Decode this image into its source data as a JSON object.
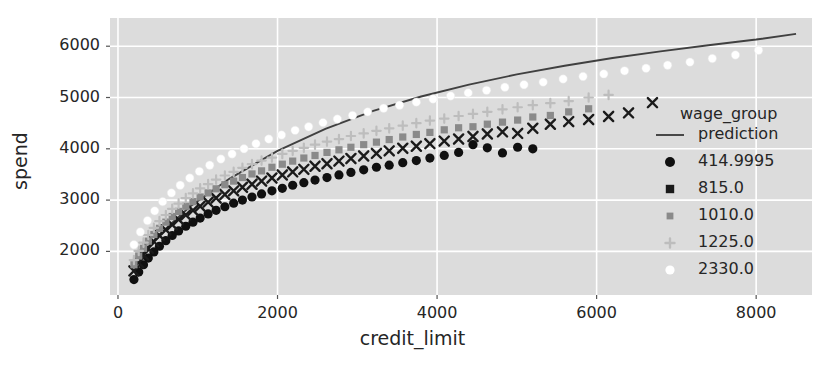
{
  "chart_data": {
    "type": "scatter",
    "title": "",
    "xlabel": "credit_limit",
    "ylabel": "spend",
    "xlim": [
      -100,
      8700
    ],
    "ylim": [
      1150,
      6550
    ],
    "xticks": [
      0,
      2000,
      4000,
      6000,
      8000
    ],
    "yticks": [
      2000,
      3000,
      4000,
      5000,
      6000
    ],
    "xtick_labels": [
      "0",
      "2000",
      "4000",
      "6000",
      "8000"
    ],
    "ytick_labels": [
      "2000",
      "3000",
      "4000",
      "5000",
      "6000"
    ],
    "grid": true,
    "grid_color": "#ffffff",
    "plot_bgcolor": "#dcdcdc",
    "fig_bgcolor": "#ffffff",
    "legend_title": "wage_group",
    "legend_position": "right",
    "series": [
      {
        "name": "prediction",
        "type": "line",
        "marker": "line",
        "color": "#404040",
        "x": [
          180,
          500,
          900,
          1400,
          2000,
          2600,
          3200,
          3800,
          4400,
          5000,
          5600,
          6200,
          6800,
          7400,
          8000,
          8500
        ],
        "y": [
          1700,
          2300,
          2870,
          3420,
          3960,
          4390,
          4740,
          5020,
          5250,
          5450,
          5620,
          5770,
          5900,
          6020,
          6130,
          6240
        ]
      },
      {
        "name": "414.9995",
        "type": "scatter",
        "marker": "circle",
        "color": "#101010",
        "x": [
          200,
          260,
          320,
          380,
          450,
          520,
          600,
          680,
          760,
          850,
          940,
          1030,
          1130,
          1230,
          1340,
          1450,
          1560,
          1680,
          1800,
          1930,
          2060,
          2190,
          2330,
          2470,
          2620,
          2770,
          2920,
          3080,
          3240,
          3400,
          3570,
          3740,
          3910,
          4090,
          4270,
          4450,
          4630,
          4820,
          5010,
          5200
        ],
        "y": [
          1450,
          1600,
          1740,
          1870,
          1990,
          2100,
          2210,
          2310,
          2400,
          2490,
          2570,
          2650,
          2730,
          2800,
          2870,
          2940,
          3000,
          3060,
          3120,
          3180,
          3230,
          3290,
          3340,
          3390,
          3440,
          3490,
          3540,
          3590,
          3640,
          3680,
          3730,
          3770,
          3820,
          3870,
          3930,
          4080,
          4020,
          3920,
          4030,
          4000
        ]
      },
      {
        "name": "815.0",
        "type": "scatter",
        "marker": "x",
        "color": "#1a1a1a",
        "x": [
          200,
          260,
          320,
          380,
          450,
          520,
          600,
          680,
          760,
          850,
          940,
          1030,
          1130,
          1230,
          1340,
          1450,
          1560,
          1680,
          1800,
          1930,
          2060,
          2190,
          2330,
          2470,
          2620,
          2770,
          2920,
          3080,
          3240,
          3400,
          3570,
          3740,
          3910,
          4090,
          4270,
          4450,
          4630,
          4820,
          5010,
          5200,
          5420,
          5650,
          5900,
          6150,
          6400,
          6700
        ],
        "y": [
          1620,
          1780,
          1930,
          2060,
          2190,
          2310,
          2420,
          2520,
          2620,
          2710,
          2800,
          2880,
          2960,
          3040,
          3110,
          3180,
          3250,
          3310,
          3370,
          3430,
          3490,
          3550,
          3600,
          3660,
          3710,
          3760,
          3810,
          3860,
          3910,
          3960,
          4010,
          4050,
          4100,
          4150,
          4190,
          4240,
          4290,
          4330,
          4300,
          4400,
          4480,
          4530,
          4570,
          4630,
          4700,
          4900
        ]
      },
      {
        "name": "1010.0",
        "type": "scatter",
        "marker": "square",
        "color": "#8a8a8a",
        "x": [
          200,
          260,
          320,
          380,
          450,
          520,
          600,
          680,
          760,
          850,
          940,
          1030,
          1130,
          1230,
          1340,
          1450,
          1560,
          1680,
          1800,
          1930,
          2060,
          2190,
          2330,
          2470,
          2620,
          2770,
          2920,
          3080,
          3240,
          3400,
          3570,
          3740,
          3910,
          4090,
          4270,
          4450,
          4630,
          4820,
          5010,
          5200,
          5420,
          5650,
          5900
        ],
        "y": [
          1740,
          1910,
          2060,
          2200,
          2330,
          2450,
          2570,
          2680,
          2780,
          2880,
          2970,
          3060,
          3140,
          3220,
          3300,
          3370,
          3440,
          3510,
          3570,
          3640,
          3700,
          3760,
          3820,
          3870,
          3930,
          3980,
          4030,
          4080,
          4130,
          4180,
          4230,
          4280,
          4320,
          4370,
          4410,
          4430,
          4480,
          4520,
          4560,
          4620,
          4650,
          4720,
          4780
        ]
      },
      {
        "name": "1225.0",
        "type": "scatter",
        "marker": "plus",
        "color": "#bdbdbd",
        "x": [
          200,
          260,
          320,
          380,
          450,
          520,
          600,
          680,
          760,
          850,
          940,
          1030,
          1130,
          1230,
          1340,
          1450,
          1560,
          1680,
          1800,
          1930,
          2060,
          2190,
          2330,
          2470,
          2620,
          2770,
          2920,
          3080,
          3240,
          3400,
          3570,
          3740,
          3910,
          4090,
          4270,
          4450,
          4630,
          4820,
          5010,
          5200,
          5420,
          5650,
          5900,
          6150
        ],
        "y": [
          1830,
          2010,
          2170,
          2320,
          2460,
          2590,
          2710,
          2830,
          2930,
          3040,
          3130,
          3230,
          3310,
          3400,
          3480,
          3550,
          3630,
          3700,
          3770,
          3830,
          3900,
          3960,
          4020,
          4080,
          4140,
          4190,
          4250,
          4300,
          4350,
          4400,
          4450,
          4500,
          4550,
          4590,
          4640,
          4680,
          4720,
          4770,
          4810,
          4850,
          4890,
          4930,
          5000,
          5050
        ]
      },
      {
        "name": "2330.0",
        "type": "scatter",
        "marker": "circle-open",
        "color": "#ffffff",
        "x": [
          200,
          280,
          370,
          460,
          560,
          670,
          780,
          900,
          1020,
          1150,
          1290,
          1430,
          1580,
          1730,
          1890,
          2050,
          2220,
          2390,
          2570,
          2750,
          2940,
          3130,
          3330,
          3530,
          3740,
          3950,
          4170,
          4390,
          4620,
          4850,
          5090,
          5330,
          5580,
          5830,
          6090,
          6350,
          6620,
          6890,
          7170,
          7450,
          7740,
          8030
        ],
        "y": [
          2130,
          2380,
          2600,
          2790,
          2970,
          3140,
          3290,
          3430,
          3560,
          3680,
          3800,
          3900,
          4000,
          4100,
          4190,
          4270,
          4360,
          4430,
          4510,
          4580,
          4650,
          4720,
          4790,
          4850,
          4910,
          4970,
          5030,
          5090,
          5140,
          5200,
          5250,
          5300,
          5360,
          5410,
          5460,
          5520,
          5570,
          5630,
          5690,
          5760,
          5830,
          5920
        ]
      }
    ]
  },
  "legend": {
    "title": "wage_group",
    "entries": [
      {
        "label": "prediction",
        "marker": "line",
        "color": "#404040"
      },
      {
        "label": "414.9995",
        "marker": "circle",
        "color": "#101010"
      },
      {
        "label": "815.0",
        "marker": "square-dark",
        "color": "#1a1a1a"
      },
      {
        "label": "1010.0",
        "marker": "square",
        "color": "#8a8a8a"
      },
      {
        "label": "1225.0",
        "marker": "plus",
        "color": "#bdbdbd"
      },
      {
        "label": "2330.0",
        "marker": "circle-open",
        "color": "#ffffff"
      }
    ]
  }
}
